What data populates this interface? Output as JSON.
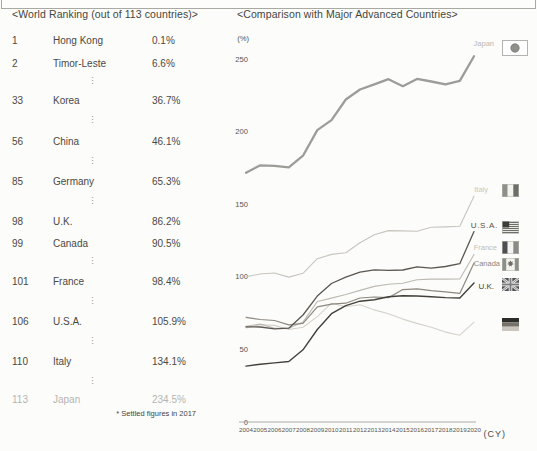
{
  "ranking": {
    "title": "<World Ranking (out of 113 countries)>",
    "footnote": "* Settled figures in 2017",
    "highlight_color": "#b5b5b2",
    "rows": [
      {
        "rank": "1",
        "country": "Hong Kong",
        "value": "0.1%"
      },
      {
        "rank": "2",
        "country": "Timor-Leste",
        "value": "6.6%"
      },
      {
        "gap": true
      },
      {
        "rank": "33",
        "country": "Korea",
        "value": "36.7%"
      },
      {
        "gap": true
      },
      {
        "rank": "56",
        "country": "China",
        "value": "46.1%"
      },
      {
        "gap": true
      },
      {
        "rank": "85",
        "country": "Germany",
        "value": "65.3%"
      },
      {
        "gap": true
      },
      {
        "rank": "98",
        "country": "U.K.",
        "value": "86.2%"
      },
      {
        "rank": "99",
        "country": "Canada",
        "value": "90.5%"
      },
      {
        "gap": true
      },
      {
        "rank": "101",
        "country": "France",
        "value": "98.4%"
      },
      {
        "gap": true
      },
      {
        "rank": "106",
        "country": "U.S.A.",
        "value": "105.9%"
      },
      {
        "gap": true
      },
      {
        "rank": "110",
        "country": "Italy",
        "value": "134.1%"
      },
      {
        "gap": true
      },
      {
        "rank": "113",
        "country": "Japan",
        "value": "234.5%",
        "highlight": true
      }
    ]
  },
  "chart_data": {
    "type": "line",
    "title": "<Comparison with Major Advanced Countries>",
    "y_axis_label": "(%)",
    "x_axis_label": "(CY)",
    "ylim": [
      0,
      260
    ],
    "yticks": [
      0,
      50,
      100,
      150,
      200,
      250
    ],
    "grid": false,
    "legend_position": "right",
    "x": [
      2004,
      2005,
      2006,
      2007,
      2008,
      2009,
      2010,
      2011,
      2012,
      2013,
      2014,
      2015,
      2016,
      2017,
      2018,
      2019,
      2020
    ],
    "series": [
      {
        "name": "Japan",
        "flag": "japan-flag-icon",
        "color": "#9c9c99",
        "width": 2.3,
        "values": [
          171.7,
          176.8,
          176.4,
          175.4,
          183.4,
          201.0,
          207.9,
          222.1,
          229.0,
          232.5,
          236.1,
          231.3,
          236.3,
          234.5,
          232.5,
          234.9,
          251.9
        ]
      },
      {
        "name": "Italy",
        "flag": "italy-flag-icon",
        "color": "#c8c5be",
        "width": 1.1,
        "values": [
          100.1,
          101.9,
          102.6,
          99.8,
          102.4,
          112.5,
          115.4,
          116.5,
          123.4,
          129.0,
          131.8,
          131.6,
          131.4,
          134.1,
          134.4,
          134.8,
          155.5
        ]
      },
      {
        "name": "U.S.A.",
        "flag": "usa-flag-icon",
        "color": "#5b5650",
        "width": 1.3,
        "values": [
          65.5,
          65.4,
          64.2,
          64.6,
          73.7,
          86.7,
          95.4,
          99.7,
          103.2,
          104.8,
          104.4,
          104.7,
          106.8,
          105.9,
          107.1,
          109.0,
          131.1
        ]
      },
      {
        "name": "France",
        "flag": "france-flag-icon",
        "color": "#bdbab3",
        "width": 1.1,
        "values": [
          65.9,
          67.4,
          64.6,
          64.5,
          68.8,
          83.0,
          85.3,
          87.8,
          90.6,
          93.4,
          94.9,
          95.6,
          98.0,
          98.4,
          98.4,
          98.5,
          115.4
        ]
      },
      {
        "name": "Canada",
        "flag": "canada-flag-icon",
        "color": "#8d8880",
        "width": 1.2,
        "values": [
          72.1,
          70.6,
          69.9,
          66.9,
          68.0,
          79.3,
          81.2,
          81.8,
          85.4,
          86.1,
          85.6,
          91.2,
          91.7,
          90.5,
          89.7,
          88.6,
          109.5
        ]
      },
      {
        "name": "U.K.",
        "flag": "uk-flag-icon",
        "color": "#44413c",
        "width": 1.4,
        "values": [
          38.5,
          39.8,
          40.7,
          41.7,
          49.7,
          63.7,
          74.6,
          80.1,
          83.2,
          84.2,
          86.2,
          86.9,
          86.8,
          86.2,
          85.7,
          85.4,
          95.7
        ]
      },
      {
        "name": "Germany",
        "flag": "germany-flag-icon",
        "color": "#d5d2cb",
        "width": 1.1,
        "values": [
          64.8,
          67.0,
          66.5,
          63.7,
          65.2,
          72.6,
          81.8,
          79.4,
          80.7,
          77.2,
          74.6,
          70.9,
          67.9,
          65.3,
          61.9,
          59.8,
          68.7
        ]
      }
    ]
  }
}
